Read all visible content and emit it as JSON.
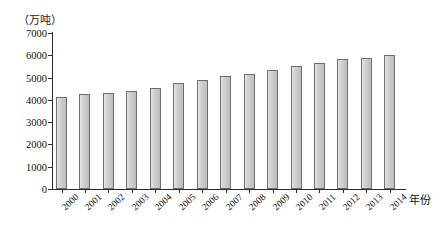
{
  "chart_data": {
    "type": "bar",
    "title": "",
    "unit_label": "（万吨）",
    "xlabel": "年份",
    "ylabel": "",
    "ylim": [
      0,
      7000
    ],
    "ytick_values": [
      0,
      1000,
      2000,
      3000,
      4000,
      5000,
      6000,
      7000
    ],
    "ytick_labels": [
      "0",
      "1000",
      "2000",
      "3000",
      "4000",
      "5000",
      "6000",
      "7000"
    ],
    "grid": false,
    "legend": "none",
    "categories": [
      "2000",
      "2001",
      "2002",
      "2003",
      "2004",
      "2005",
      "2006",
      "2007",
      "2008",
      "2009",
      "2010",
      "2011",
      "2012",
      "2013",
      "2014"
    ],
    "values": [
      4150,
      4250,
      4300,
      4380,
      4550,
      4750,
      4900,
      5050,
      5150,
      5350,
      5500,
      5650,
      5850,
      5900,
      6000
    ],
    "bar_color": "#cccccc",
    "bar_edge_color": "#6e6e6e",
    "axis_color": "#2b2b2b"
  }
}
